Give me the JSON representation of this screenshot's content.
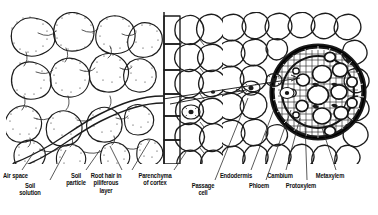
{
  "figure": {
    "regions": [
      {
        "id": "soil",
        "name": "soil with particles, air spaces and soil solution"
      },
      {
        "id": "piliferous",
        "name": "piliferous layer (epidermis) bearing root hair"
      },
      {
        "id": "cortex",
        "name": "parenchyma of cortex"
      },
      {
        "id": "endodermis",
        "name": "endodermis ring with passage cells"
      },
      {
        "id": "stele",
        "name": "vascular cylinder: phloem, cambium, protoxylem, metaxylem"
      }
    ]
  },
  "labels": [
    {
      "id": "air-space",
      "text": "Air space",
      "x": 3,
      "y": 172,
      "align": "left"
    },
    {
      "id": "soil-solution",
      "text": "Soil\nsolution",
      "x": 30,
      "y": 182,
      "align": "center"
    },
    {
      "id": "soil-particle",
      "text": "Soil\nparticle",
      "x": 76,
      "y": 172,
      "align": "center"
    },
    {
      "id": "root-hair",
      "text": "Root hair in\npiliferous\nlayer",
      "x": 106,
      "y": 172,
      "align": "center"
    },
    {
      "id": "parenchyma",
      "text": "Parenchyma\nof cortex",
      "x": 155,
      "y": 172,
      "align": "center"
    },
    {
      "id": "passage-cell",
      "text": "Passage\ncell",
      "x": 203,
      "y": 182,
      "align": "center"
    },
    {
      "id": "endodermis",
      "text": "Endodermis",
      "x": 236,
      "y": 172,
      "align": "center"
    },
    {
      "id": "phloem",
      "text": "Phloem",
      "x": 259,
      "y": 182,
      "align": "center"
    },
    {
      "id": "cambium",
      "text": "Cambium",
      "x": 280,
      "y": 172,
      "align": "center"
    },
    {
      "id": "protoxylem",
      "text": "Protoxylem",
      "x": 301,
      "y": 182,
      "align": "center"
    },
    {
      "id": "metaxylem",
      "text": "Metaxylem",
      "x": 330,
      "y": 172,
      "align": "center"
    }
  ],
  "colors": {
    "ink": "#1a1a1a",
    "stipple": "#3a3a3a",
    "paper": "#ffffff",
    "leader": "#222222"
  }
}
